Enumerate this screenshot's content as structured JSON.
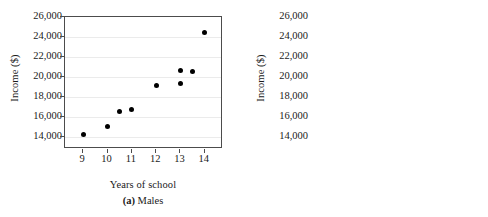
{
  "figure": {
    "background": "#ffffff",
    "dot_color": "#000000",
    "axis_color": "#4c4c4c",
    "grid_color": "#ebebeb"
  },
  "chart_data": [
    {
      "type": "scatter",
      "title": "(a) Males",
      "panel_letter": "a",
      "panel_name": "Males",
      "xlabel": "Years of school",
      "ylabel": "Income ($)",
      "xlim": [
        8.25,
        14.75
      ],
      "ylim": [
        12800,
        26000
      ],
      "xticks": [
        9,
        10,
        11,
        12,
        13,
        14
      ],
      "xticklabels": [
        "9",
        "10",
        "11",
        "12",
        "13",
        "14"
      ],
      "yticks": [
        14000,
        16000,
        18000,
        20000,
        22000,
        24000,
        26000
      ],
      "yticklabels": [
        "14,000",
        "16,000",
        "18,000",
        "20,000",
        "22,000",
        "24,000",
        "26,000"
      ],
      "grid": true,
      "legend": "none",
      "points": [
        {
          "x": 9.0,
          "y": 14250
        },
        {
          "x": 10.0,
          "y": 15100
        },
        {
          "x": 10.5,
          "y": 16600
        },
        {
          "x": 11.0,
          "y": 16800
        },
        {
          "x": 12.0,
          "y": 19150
        },
        {
          "x": 13.0,
          "y": 20650
        },
        {
          "x": 13.0,
          "y": 19400
        },
        {
          "x": 13.5,
          "y": 20550
        },
        {
          "x": 14.0,
          "y": 24500
        }
      ]
    },
    {
      "type": "scatter",
      "title": "(b) Females",
      "panel_letter": "b",
      "panel_name": "Females",
      "xlabel": "Years of school",
      "ylabel": "Income ($)",
      "xlim": [
        8.25,
        14.75
      ],
      "ylim": [
        12800,
        26000
      ],
      "xticks": [
        9,
        10,
        11,
        12,
        13,
        14
      ],
      "xticklabels": [
        "9",
        "10",
        "11",
        "12",
        "13",
        "14"
      ],
      "yticks": [
        14000,
        16000,
        18000,
        20000,
        22000,
        24000,
        26000
      ],
      "yticklabels": [
        "14,000",
        "16,000",
        "18,000",
        "20,000",
        "22,000",
        "24,000",
        "26,000"
      ],
      "grid": true,
      "legend": "none",
      "points": [
        {
          "x": 9.0,
          "y": 16700
        },
        {
          "x": 9.0,
          "y": 14200
        },
        {
          "x": 9.9,
          "y": 17250
        },
        {
          "x": 10.4,
          "y": 14850
        },
        {
          "x": 11.0,
          "y": 21150
        },
        {
          "x": 11.95,
          "y": 19500
        },
        {
          "x": 11.95,
          "y": 17150
        },
        {
          "x": 12.95,
          "y": 17550
        },
        {
          "x": 13.45,
          "y": 22650
        }
      ]
    }
  ]
}
